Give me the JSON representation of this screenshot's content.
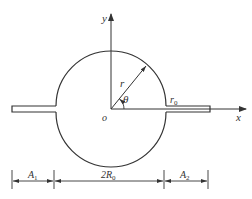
{
  "diagram": {
    "type": "geometry-figure",
    "axes": {
      "x_label": "x",
      "y_label": "y",
      "origin_label": "o"
    },
    "radius_label": "r",
    "angle_label": "θ",
    "slot_label": "r",
    "slot_label_sub": "0",
    "dimensions": [
      {
        "label": "A",
        "sub": "1"
      },
      {
        "label": "2R",
        "sub": "0"
      },
      {
        "label": "A",
        "sub": "2"
      }
    ],
    "stroke_color": "#333333"
  }
}
